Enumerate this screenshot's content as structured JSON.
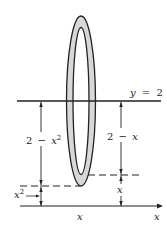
{
  "diagram": {
    "line_label": {
      "var": "y",
      "eq": "=",
      "val": "2"
    },
    "outer_radius_label": {
      "a": "2",
      "op": "−",
      "b": "x",
      "sup": "2"
    },
    "inner_radius_label": {
      "a": "2",
      "op": "−",
      "b": "x"
    },
    "left_small_label": {
      "b": "x",
      "sup": "2"
    },
    "right_small_label": "x",
    "axis_x_tick_label": "x",
    "axis_label": "x",
    "colors": {
      "stroke": "#222222",
      "fill": "#d8d8d8"
    }
  }
}
